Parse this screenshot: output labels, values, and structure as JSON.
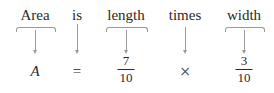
{
  "words": [
    "Area",
    "is",
    "length",
    "times",
    "width"
  ],
  "expression": {
    "variable": "A",
    "equals": "=",
    "fraction1": {
      "numerator": "7",
      "denominator": "10"
    },
    "operator": "×",
    "fraction2": {
      "numerator": "3",
      "denominator": "10"
    }
  }
}
